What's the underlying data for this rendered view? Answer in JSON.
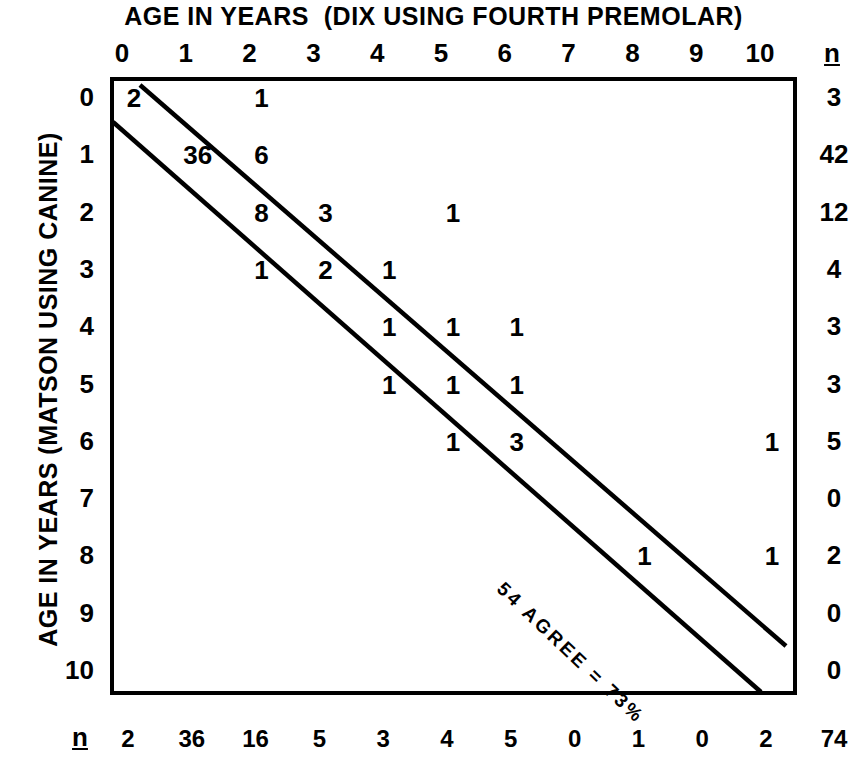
{
  "chart_data": {
    "type": "heatmap",
    "title": "AGE IN YEARS  (DIX USING FOURTH PREMOLAR)",
    "xlabel": "AGE IN YEARS  (DIX USING FOURTH PREMOLAR)",
    "ylabel": "AGE IN YEARS (MATSON USING CANINE)",
    "x_tick_labels": [
      "0",
      "1",
      "2",
      "3",
      "4",
      "5",
      "6",
      "7",
      "8",
      "9",
      "10"
    ],
    "y_tick_labels": [
      "0",
      "1",
      "2",
      "3",
      "4",
      "5",
      "6",
      "7",
      "8",
      "9",
      "10"
    ],
    "xlim": [
      0,
      10
    ],
    "ylim": [
      0,
      10
    ],
    "grid": false,
    "legend": "none",
    "annotation": "54 AGREE = 73%",
    "n_header": "n",
    "cells": [
      {
        "x": 0,
        "y": 0,
        "value": "2"
      },
      {
        "x": 2,
        "y": 0,
        "value": "1"
      },
      {
        "x": 1,
        "y": 1,
        "value": "36"
      },
      {
        "x": 2,
        "y": 1,
        "value": "6"
      },
      {
        "x": 2,
        "y": 2,
        "value": "8"
      },
      {
        "x": 3,
        "y": 2,
        "value": "3"
      },
      {
        "x": 5,
        "y": 2,
        "value": "1"
      },
      {
        "x": 2,
        "y": 3,
        "value": "1"
      },
      {
        "x": 3,
        "y": 3,
        "value": "2"
      },
      {
        "x": 4,
        "y": 3,
        "value": "1"
      },
      {
        "x": 4,
        "y": 4,
        "value": "1"
      },
      {
        "x": 5,
        "y": 4,
        "value": "1"
      },
      {
        "x": 6,
        "y": 4,
        "value": "1"
      },
      {
        "x": 4,
        "y": 5,
        "value": "1"
      },
      {
        "x": 5,
        "y": 5,
        "value": "1"
      },
      {
        "x": 6,
        "y": 5,
        "value": "1"
      },
      {
        "x": 5,
        "y": 6,
        "value": "1"
      },
      {
        "x": 6,
        "y": 6,
        "value": "3"
      },
      {
        "x": 10,
        "y": 6,
        "value": "1"
      },
      {
        "x": 8,
        "y": 8,
        "value": "1"
      },
      {
        "x": 10,
        "y": 8,
        "value": "1"
      }
    ],
    "row_totals": [
      "3",
      "42",
      "12",
      "4",
      "3",
      "3",
      "5",
      "0",
      "2",
      "0",
      "0"
    ],
    "column_totals": [
      "2",
      "36",
      "16",
      "5",
      "3",
      "4",
      "5",
      "0",
      "1",
      "0",
      "2"
    ],
    "grand_total": "74",
    "band_lines": [
      {
        "name": "upper-agreement-band",
        "x1": 140,
        "y1": 85,
        "x2": 786,
        "y2": 646
      },
      {
        "name": "lower-agreement-band",
        "x1": 113,
        "y1": 122,
        "x2": 761,
        "y2": 692
      }
    ],
    "colors": {
      "ink": "#000000",
      "background": "#ffffff"
    }
  }
}
